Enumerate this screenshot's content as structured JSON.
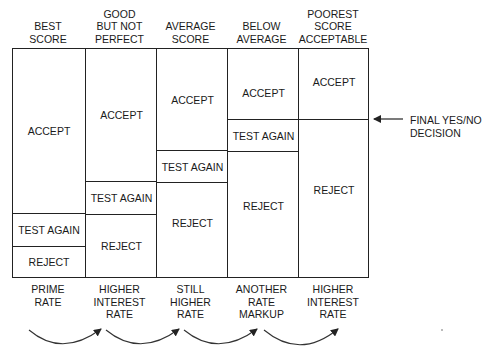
{
  "diagram": {
    "columns": [
      {
        "header": "BEST\nSCORE",
        "cells": [
          {
            "label": "ACCEPT",
            "top": 0,
            "height": 164
          },
          {
            "label": "TEST AGAIN",
            "top": 164,
            "height": 33
          },
          {
            "label": "REJECT",
            "top": 197,
            "height": 33
          }
        ],
        "footer": "PRIME\nRATE"
      },
      {
        "header": "GOOD\nBUT NOT\nPERFECT",
        "cells": [
          {
            "label": "ACCEPT",
            "top": 0,
            "height": 132
          },
          {
            "label": "TEST AGAIN",
            "top": 132,
            "height": 33
          },
          {
            "label": "REJECT",
            "top": 165,
            "height": 65
          }
        ],
        "footer": "HIGHER\nINTEREST\nRATE"
      },
      {
        "header": "AVERAGE\nSCORE",
        "cells": [
          {
            "label": "ACCEPT",
            "top": 0,
            "height": 101
          },
          {
            "label": "TEST AGAIN",
            "top": 101,
            "height": 32
          },
          {
            "label": "REJECT",
            "top": 133,
            "height": 97
          }
        ],
        "footer": "STILL\nHIGHER\nRATE"
      },
      {
        "header": "BELOW\nAVERAGE",
        "cells": [
          {
            "label": "ACCEPT",
            "top": 0,
            "height": 70
          },
          {
            "label": "TEST AGAIN",
            "top": 70,
            "height": 32
          },
          {
            "label": "REJECT",
            "top": 102,
            "height": 128
          }
        ],
        "footer": "ANOTHER\nRATE\nMARKUP"
      },
      {
        "header": "POOREST\nSCORE\nACCEPTABLE",
        "cells": [
          {
            "label": "ACCEPT",
            "top": 0,
            "height": 70
          },
          {
            "label": "REJECT",
            "top": 70,
            "height": 160
          }
        ],
        "footer": "HIGHER\nINTEREST\nRATE"
      }
    ],
    "annotation": {
      "label": "FINAL YES/NO\nDECISION",
      "arrow": "left-arrow"
    },
    "connectors": "curved-arrows-between-rate-labels",
    "colors": {
      "line": "#222222",
      "text": "#1a1a1a",
      "background": "#ffffff"
    }
  }
}
